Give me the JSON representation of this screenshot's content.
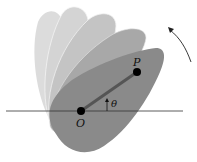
{
  "figure": {
    "labels": {
      "point_p": "P",
      "point_o": "O",
      "angle": "θ"
    },
    "colors": {
      "background": "#ffffff",
      "body_current": "#8a8a8a",
      "body_ghost_1": "#a6a6a6",
      "body_ghost_2": "#c6c6c6",
      "body_ghost_3": "#d2d2d2",
      "body_ghost_4": "#dadada",
      "reference_line": "#333333",
      "segment_op": "#555555",
      "points": "#000000"
    },
    "rotation_direction": "counterclockwise"
  }
}
